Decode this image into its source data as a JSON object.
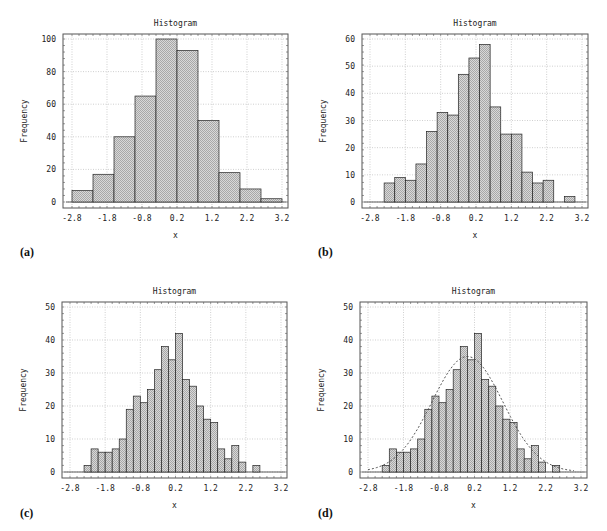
{
  "figure": {
    "panels": [
      {
        "id": "a",
        "label": "(a)"
      },
      {
        "id": "b",
        "label": "(b)"
      },
      {
        "id": "c",
        "label": "(c)"
      },
      {
        "id": "d",
        "label": "(d)"
      }
    ]
  },
  "style": {
    "bar_fill": "#c8c8c8",
    "bar_stroke": "#222222",
    "grid_color": "#bbbbbb",
    "frame_color": "#555555",
    "curve_color": "#444444"
  },
  "chart_data": [
    {
      "panel": "a",
      "type": "bar",
      "title": "Histogram",
      "xlabel": "x",
      "ylabel": "Frequency",
      "xlim": [
        -2.8,
        3.2
      ],
      "ylim": [
        0,
        100
      ],
      "xticks": [
        -2.8,
        -1.8,
        -0.8,
        0.2,
        1.2,
        2.2,
        3.2
      ],
      "xtick_labels": [
        "-2.8",
        "-1.8",
        "-0.8",
        "0.2",
        "1.2",
        "2.2",
        "3.2"
      ],
      "yticks": [
        0,
        20,
        40,
        60,
        80,
        100
      ],
      "grid": true,
      "bin_start": -2.8,
      "bin_width": 0.6,
      "values": [
        7,
        17,
        40,
        65,
        100,
        93,
        50,
        18,
        8,
        2
      ]
    },
    {
      "panel": "b",
      "type": "bar",
      "title": "Histogram",
      "xlabel": "x",
      "ylabel": "Frequency",
      "xlim": [
        -2.8,
        3.2
      ],
      "ylim": [
        0,
        60
      ],
      "xticks": [
        -2.8,
        -1.8,
        -0.8,
        0.2,
        1.2,
        2.2,
        3.2
      ],
      "xtick_labels": [
        "-2.8",
        "-1.8",
        "-0.8",
        "0.2",
        "1.2",
        "2.2",
        "3.2"
      ],
      "yticks": [
        0,
        10,
        20,
        30,
        40,
        50,
        60
      ],
      "grid": true,
      "bin_start": -2.4,
      "bin_width": 0.3,
      "values": [
        7,
        9,
        8,
        14,
        26,
        33,
        32,
        47,
        53,
        58,
        35,
        25,
        25,
        11,
        7,
        8,
        0,
        2
      ]
    },
    {
      "panel": "c",
      "type": "bar",
      "title": "Histogram",
      "xlabel": "x",
      "ylabel": "Frequency",
      "xlim": [
        -2.8,
        3.2
      ],
      "ylim": [
        0,
        50
      ],
      "xticks": [
        -2.8,
        -1.8,
        -0.8,
        0.2,
        1.2,
        2.2,
        3.2
      ],
      "xtick_labels": [
        "-2.8",
        "-1.8",
        "-0.8",
        "0.2",
        "1.2",
        "2.2",
        "3.2"
      ],
      "yticks": [
        0,
        10,
        20,
        30,
        40,
        50
      ],
      "grid": true,
      "bin_start": -2.4,
      "bin_width": 0.2,
      "values": [
        2,
        7,
        6,
        6,
        7,
        10,
        19,
        23,
        21,
        25,
        31,
        38,
        34,
        42,
        28,
        26,
        20,
        16,
        15,
        7,
        4,
        8,
        3,
        0,
        2
      ]
    },
    {
      "panel": "d",
      "type": "bar",
      "title": "Histogram",
      "xlabel": "x",
      "ylabel": "Frequency",
      "xlim": [
        -2.8,
        3.2
      ],
      "ylim": [
        0,
        50
      ],
      "xticks": [
        -2.8,
        -1.8,
        -0.8,
        0.2,
        1.2,
        2.2,
        3.2
      ],
      "xtick_labels": [
        "-2.8",
        "-1.8",
        "-0.8",
        "0.2",
        "1.2",
        "2.2",
        "3.2"
      ],
      "yticks": [
        0,
        10,
        20,
        30,
        40,
        50
      ],
      "grid": true,
      "bin_start": -2.4,
      "bin_width": 0.2,
      "values": [
        2,
        7,
        6,
        6,
        7,
        10,
        19,
        23,
        21,
        25,
        31,
        38,
        34,
        42,
        28,
        26,
        20,
        16,
        15,
        7,
        4,
        8,
        3,
        0,
        2
      ],
      "overlay": {
        "type": "line",
        "style": "dashed",
        "name": "normal fit",
        "mean": 0.0,
        "sd": 1.0,
        "peak": 35,
        "x_range": [
          -2.8,
          3.0
        ]
      }
    }
  ]
}
